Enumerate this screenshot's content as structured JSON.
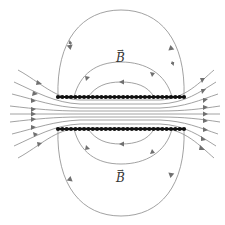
{
  "diagram": {
    "labels": {
      "upper_field": "B",
      "lower_field": "B",
      "vector_mark": "→"
    },
    "colors": {
      "field_line": "#8a8a8a",
      "arrow": "#707070",
      "wire": "#111111",
      "background": "#ffffff"
    },
    "solenoid": {
      "top_row_y": 97,
      "bottom_row_y": 129,
      "x_start": 58,
      "x_end": 184,
      "wire_count": 30
    },
    "field_direction": "interior left-to-right; exterior return loops right-to-left"
  }
}
